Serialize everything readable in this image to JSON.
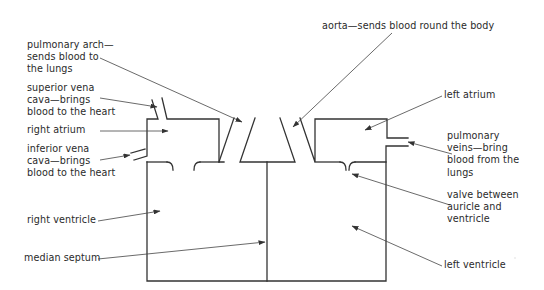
{
  "diagram": {
    "colors": {
      "line": "#333333",
      "text": "#2a2a2a",
      "background": "#ffffff"
    },
    "labels": {
      "pulmonary_arch": "pulmonary arch—\nsends blood to\nthe lungs",
      "aorta": "aorta—sends blood round the body",
      "superior_vena_cava": "superior vena\ncava—brings\nblood to the heart",
      "right_atrium": "right atrium",
      "inferior_vena_cava": "inferior vena\ncava—brings\nblood to the heart",
      "left_atrium": "left atrium",
      "pulmonary_veins": "pulmonary\nveins—bring\nblood from the\nlungs",
      "valve": "valve between\nauricle and\nventricle",
      "right_ventricle": "right ventricle",
      "median_septum": "median septum",
      "left_ventricle": "left ventricle"
    }
  }
}
